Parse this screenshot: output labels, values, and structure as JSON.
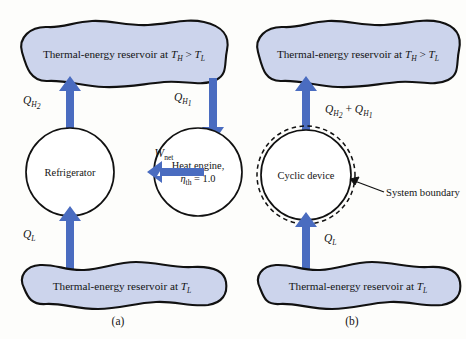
{
  "figure": {
    "background_color": "#fdfdfb",
    "reservoir_fill": "#ccd4ec",
    "reservoir_stroke": "#000000",
    "arrow_color": "#4a6cc0",
    "device_stroke": "#111111"
  },
  "panel_a": {
    "label": "(a)",
    "top_reservoir": {
      "prefix": "Thermal-energy reservoir at ",
      "t_hot": "T",
      "t_hot_sub": "H",
      "relation": " > ",
      "t_cold": "T",
      "t_cold_sub": "L"
    },
    "bottom_reservoir": {
      "prefix": "Thermal-energy reservoir at ",
      "t_cold": "T",
      "t_cold_sub": "L"
    },
    "refrigerator": {
      "label": "Refrigerator"
    },
    "heat_engine": {
      "line1": "Heat engine,",
      "eta": "η",
      "eta_sub": "th",
      "eta_value": " = 1.0"
    },
    "arrows": {
      "q_h2": {
        "base": "Q",
        "sub": "H",
        "subnum": "2",
        "direction": "up"
      },
      "q_h1": {
        "base": "Q",
        "sub": "H",
        "subnum": "1",
        "direction": "down"
      },
      "q_l": {
        "base": "Q",
        "sub": "L",
        "direction": "up"
      },
      "w_net": {
        "base": "W",
        "sub": "net",
        "direction": "left"
      }
    }
  },
  "panel_b": {
    "label": "(b)",
    "top_reservoir": {
      "prefix": "Thermal-energy reservoir at ",
      "t_hot": "T",
      "t_hot_sub": "H",
      "relation": " > ",
      "t_cold": "T",
      "t_cold_sub": "L"
    },
    "bottom_reservoir": {
      "prefix": "Thermal-energy reservoir at ",
      "t_cold": "T",
      "t_cold_sub": "L"
    },
    "cyclic_device": {
      "label": "Cyclic device"
    },
    "system_boundary": {
      "label": "System boundary"
    },
    "arrows": {
      "q_sum": {
        "base1": "Q",
        "sub1": "H",
        "subnum1": "2",
        "plus": " + ",
        "base2": "Q",
        "sub2": "H",
        "subnum2": "1",
        "direction": "up"
      },
      "q_l": {
        "base": "Q",
        "sub": "L",
        "direction": "up"
      }
    }
  }
}
